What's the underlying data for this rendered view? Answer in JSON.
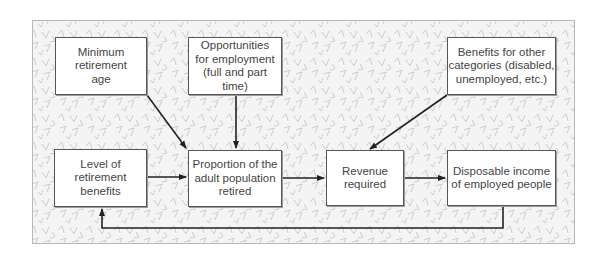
{
  "diagram": {
    "type": "flowchart",
    "nodes": [
      {
        "id": "min_age",
        "label": "Minimum\nretirement\nage"
      },
      {
        "id": "opportunities",
        "label": "Opportunities\nfor employment\n(full and part time)"
      },
      {
        "id": "benefits_other",
        "label": "Benefits for other\ncategories (disabled,\nunemployed, etc.)"
      },
      {
        "id": "level_benefits",
        "label": "Level of\nretirement\nbenefits"
      },
      {
        "id": "proportion",
        "label": "Proportion of the\nadult population\nretired"
      },
      {
        "id": "revenue",
        "label": "Revenue\nrequired"
      },
      {
        "id": "disposable",
        "label": "Disposable income\nof employed people"
      }
    ],
    "edges": [
      {
        "from": "min_age",
        "to": "proportion"
      },
      {
        "from": "opportunities",
        "to": "proportion"
      },
      {
        "from": "level_benefits",
        "to": "proportion"
      },
      {
        "from": "proportion",
        "to": "revenue"
      },
      {
        "from": "benefits_other",
        "to": "revenue"
      },
      {
        "from": "revenue",
        "to": "disposable"
      },
      {
        "from": "disposable",
        "to": "level_benefits"
      }
    ],
    "colors": {
      "background": "#f4f4f4",
      "pattern": "#bdbdbd",
      "box_border": "#555555",
      "arrow": "#222222",
      "text": "#444444"
    }
  }
}
